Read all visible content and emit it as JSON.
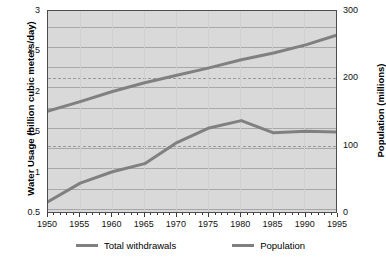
{
  "chart_data": {
    "type": "line",
    "title": "",
    "xlabel": "",
    "ylabel": "Water Usage (billion cubic meters/day)",
    "y2label": "Population (millions)",
    "xlim": [
      1950,
      1995
    ],
    "ylim": [
      0.5,
      3
    ],
    "y2lim": [
      0,
      300
    ],
    "grid": true,
    "legend_position": "bottom",
    "x_ticks": [
      1950,
      1955,
      1960,
      1965,
      1970,
      1975,
      1980,
      1985,
      1990,
      1995
    ],
    "x_minor_step": 1,
    "y_ticks": [
      0.5,
      1,
      1.5,
      2,
      2.5,
      3
    ],
    "y_minor_ticks": [
      0.75,
      1.25,
      1.75,
      2.25,
      2.75
    ],
    "y2_ticks": [
      0,
      100,
      200,
      300
    ],
    "series": [
      {
        "name": "Total withdrawals",
        "axis": "left",
        "color": "#808080",
        "x": [
          1950,
          1955,
          1960,
          1965,
          1970,
          1975,
          1980,
          1985,
          1990,
          1995
        ],
        "values": [
          0.65,
          0.88,
          1.02,
          1.12,
          1.38,
          1.56,
          1.65,
          1.5,
          1.52,
          1.51
        ]
      },
      {
        "name": "Population",
        "axis": "right",
        "color": "#808080",
        "x": [
          1950,
          1955,
          1960,
          1965,
          1970,
          1975,
          1980,
          1985,
          1990,
          1995
        ],
        "values": [
          152,
          166,
          181,
          194,
          205,
          216,
          228,
          238,
          250,
          265
        ]
      }
    ]
  },
  "axes": {
    "left": {
      "title": "Water Usage (billion cubic meters/day)",
      "ticks": [
        "3",
        "2.5",
        "2",
        "1.5",
        "1",
        "0.5"
      ]
    },
    "right": {
      "title": "Population (millions)",
      "ticks": [
        "300",
        "200",
        "100",
        "0"
      ]
    },
    "bottom": {
      "ticks": [
        "1950",
        "1955",
        "1960",
        "1965",
        "1970",
        "1975",
        "1980",
        "1985",
        "1990",
        "1995"
      ]
    }
  },
  "legend": {
    "items": [
      {
        "label": "Total withdrawals"
      },
      {
        "label": "Population"
      }
    ]
  }
}
